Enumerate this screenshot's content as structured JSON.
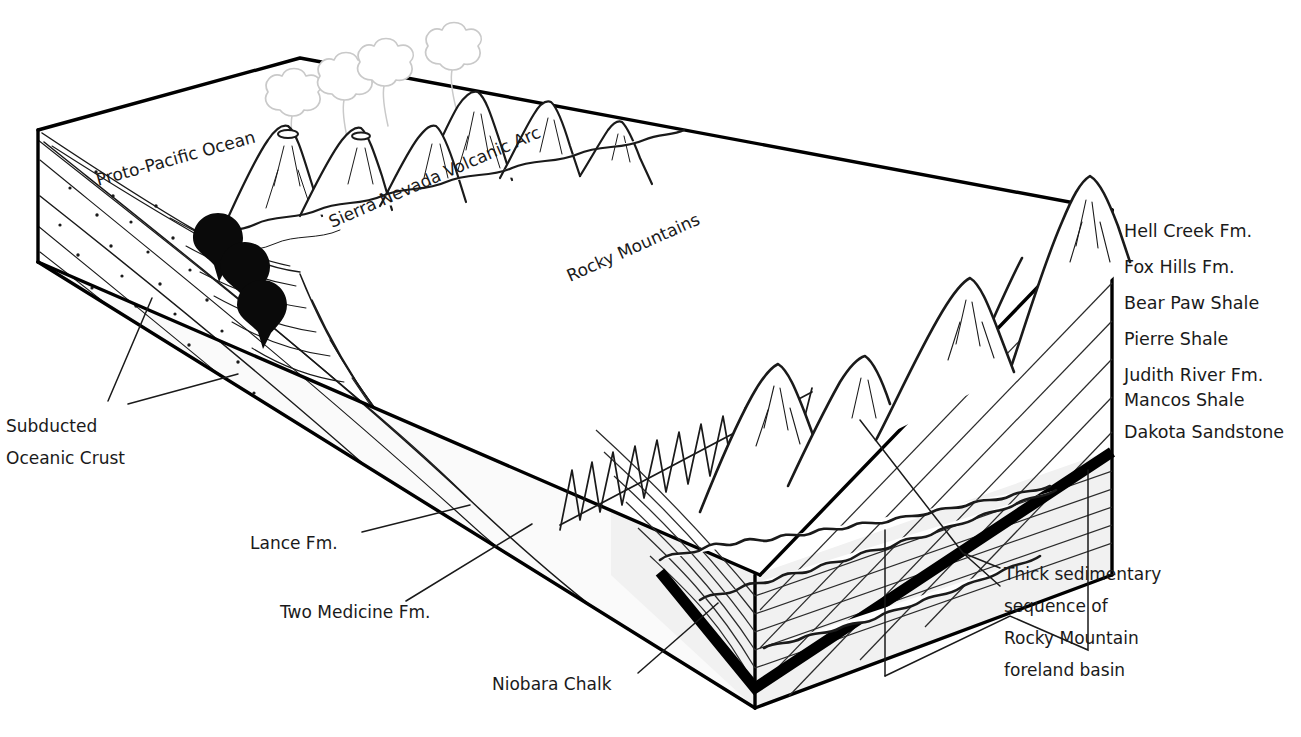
{
  "figure": {
    "type": "geologic-block-diagram",
    "background_color": "#ffffff",
    "ink_color": "#1a1a1a",
    "layer_fill_color": "#f1f1f1",
    "plume_color": "#c9c9c9",
    "magma_color": "#0a0a0a"
  },
  "scene_labels": {
    "ocean": "Proto-Pacific Ocean",
    "volcanic_arc": "Sierra Nevada Volcanic Arc",
    "mountains": "Rocky Mountains"
  },
  "stratigraphy": {
    "heading": "Stratigraphic units (top to bottom)",
    "units": [
      {
        "name": "Hell Creek Fm."
      },
      {
        "name": "Fox Hills Fm."
      },
      {
        "name": "Bear Paw Shale"
      },
      {
        "name": "Pierre Shale"
      },
      {
        "name": "Judith River Fm."
      },
      {
        "name": "Mancos Shale"
      },
      {
        "name": "Dakota Sandstone"
      }
    ]
  },
  "callouts": {
    "subducted_crust": {
      "line1": "Subducted",
      "line2": "Oceanic Crust"
    },
    "lance": "Lance Fm.",
    "two_medicine": "Two Medicine Fm.",
    "niobara": "Niobara Chalk",
    "foreland_basin": {
      "line1": "Thick sedimentary",
      "line2": "sequence of",
      "line3": "Rocky Mountain",
      "line4": "foreland basin"
    }
  }
}
